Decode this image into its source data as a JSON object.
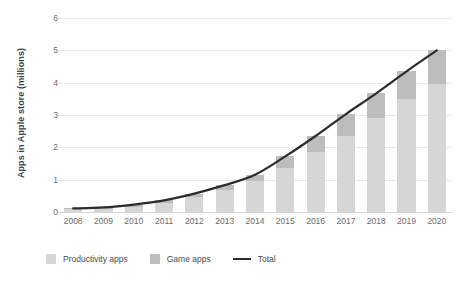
{
  "chart_data": {
    "type": "bar",
    "title": "",
    "subtitle": "",
    "xlabel": "",
    "ylabel": "Apps in Apple store (millions)",
    "categories": [
      "2008",
      "2009",
      "2010",
      "2011",
      "2012",
      "2013",
      "2014",
      "2015",
      "2016",
      "2017",
      "2018",
      "2019",
      "2020"
    ],
    "ylim": [
      0,
      6
    ],
    "yticks": [
      0,
      1,
      2,
      3,
      4,
      5,
      6
    ],
    "ytick_labels": [
      "0",
      "1",
      "2",
      "3",
      "4",
      "5",
      "6"
    ],
    "grid": true,
    "stacked": true,
    "legend_position": "bottom",
    "series": [
      {
        "name": "Productivity apps",
        "type": "bar",
        "color": "#d6d6d6",
        "values": [
          0.08,
          0.1,
          0.17,
          0.27,
          0.45,
          0.68,
          0.95,
          1.35,
          1.85,
          2.35,
          2.9,
          3.5,
          3.95
        ]
      },
      {
        "name": "Game apps",
        "type": "bar",
        "color": "#bdbdbd",
        "values": [
          0.03,
          0.04,
          0.06,
          0.09,
          0.12,
          0.15,
          0.2,
          0.37,
          0.5,
          0.68,
          0.77,
          0.85,
          1.05
        ]
      },
      {
        "name": "Total",
        "type": "line",
        "color": "#2b2b2b",
        "values": [
          0.11,
          0.14,
          0.23,
          0.36,
          0.57,
          0.83,
          1.15,
          1.72,
          2.35,
          3.03,
          3.67,
          4.35,
          5.0
        ]
      }
    ],
    "legend": [
      {
        "label": "Productivity apps",
        "marker": "swatch",
        "color": "#d6d6d6"
      },
      {
        "label": "Game apps",
        "marker": "swatch",
        "color": "#bdbdbd"
      },
      {
        "label": "Total",
        "marker": "line",
        "color": "#2b2b2b"
      }
    ]
  }
}
